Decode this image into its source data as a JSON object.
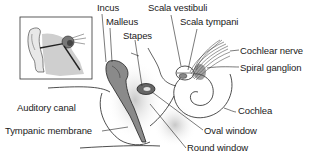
{
  "diagram": {
    "type": "anatomical-illustration",
    "inset": {
      "description": "Outer ear overview with ear canal and inner ear structures"
    },
    "labels": [
      {
        "id": "incus",
        "text": "Incus"
      },
      {
        "id": "malleus",
        "text": "Malleus"
      },
      {
        "id": "stapes",
        "text": "Stapes"
      },
      {
        "id": "scala-vestibuli",
        "text": "Scala vestibuli"
      },
      {
        "id": "scala-tympani",
        "text": "Scala tympani"
      },
      {
        "id": "cochlear-nerve",
        "text": "Cochlear nerve"
      },
      {
        "id": "spiral-ganglion",
        "text": "Spiral ganglion"
      },
      {
        "id": "cochlea",
        "text": "Cochlea"
      },
      {
        "id": "auditory-canal",
        "text": "Auditory canal"
      },
      {
        "id": "tympanic-membrane",
        "text": "Tympanic membrane"
      },
      {
        "id": "oval-window",
        "text": "Oval window"
      },
      {
        "id": "round-window",
        "text": "Round window"
      }
    ],
    "colors": {
      "ink": "#1a1a1a",
      "shade_dark": "#6e6e6e",
      "shade_mid": "#a8a8a8",
      "shade_light": "#d4d4d4",
      "background": "#ffffff"
    }
  }
}
